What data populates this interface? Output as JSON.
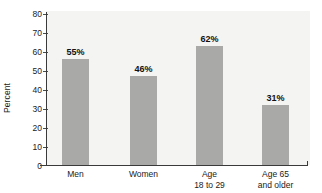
{
  "chart_data": {
    "type": "bar",
    "title": "",
    "subtitle": "",
    "xlabel": "",
    "ylabel": "Percent",
    "categories": [
      "Men",
      "Women",
      "Age 18 to 29",
      "Age 65 and older"
    ],
    "category_lines": [
      [
        "Men",
        ""
      ],
      [
        "Women",
        ""
      ],
      [
        "Age",
        "18 to 29"
      ],
      [
        "Age 65",
        "and older"
      ]
    ],
    "values": [
      55,
      46,
      62,
      31
    ],
    "value_labels": [
      "55%",
      "46%",
      "62%",
      "31%"
    ],
    "ylim": [
      0,
      80
    ],
    "yticks": [
      0,
      10,
      20,
      30,
      40,
      50,
      60,
      70,
      80
    ],
    "ytick_labels": [
      "0",
      "10",
      "20",
      "30",
      "40",
      "50",
      "60",
      "70",
      "80"
    ],
    "grid": false,
    "legend": null,
    "legend_position": "none",
    "colors": {
      "bar_fill": "#a9a9a8",
      "plot_background": "#f4f4f3",
      "figure_background": "#ffffff",
      "axis_line": "#3a3a3a",
      "text": "#1a1a1a",
      "value_label_text": "#111111"
    }
  }
}
